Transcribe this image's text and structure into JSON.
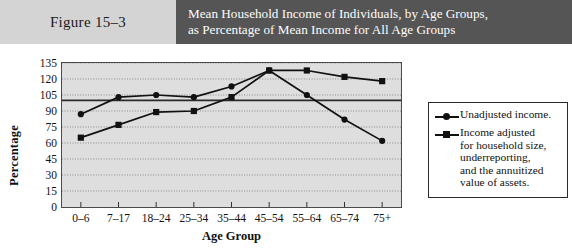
{
  "header": {
    "figure_label": "Figure 15–3",
    "title_lines": [
      "Mean Household Income of Individuals, by Age Groups,",
      "as Percentage of Mean Income for All Age Groups"
    ],
    "figure_band_color": "#d4d4d4",
    "title_band_color": "#555555"
  },
  "legend": {
    "entries": [
      {
        "marker": "circle",
        "lines": [
          "Unadjusted income."
        ]
      },
      {
        "marker": "square",
        "lines": [
          "Income adjusted",
          "for household size,",
          "underreporting,",
          "and the annuitized",
          "value of assets."
        ]
      }
    ]
  },
  "chart_data": {
    "type": "line",
    "title": "Mean Household Income of Individuals, by Age Groups, as Percentage of Mean Income for All Age Groups",
    "xlabel": "Age Group",
    "ylabel": "Percentage",
    "categories": [
      "0–6",
      "7–17",
      "18–24",
      "25–34",
      "35–44",
      "45–54",
      "55–64",
      "65–74",
      "75+"
    ],
    "yticks": [
      0,
      15,
      30,
      45,
      60,
      75,
      90,
      105,
      120,
      135
    ],
    "ylim": [
      0,
      135
    ],
    "grid": true,
    "legend_position": "right",
    "reference_line": {
      "value": 100,
      "label": "100%"
    },
    "series": [
      {
        "name": "Unadjusted income.",
        "marker": "circle",
        "values": [
          87,
          103,
          105,
          103,
          113,
          128,
          105,
          82,
          62
        ]
      },
      {
        "name": "Income adjusted for household size, underreporting, and the annuitized value of assets.",
        "marker": "square",
        "values": [
          65,
          77,
          89,
          90,
          103,
          128,
          128,
          122,
          118
        ]
      }
    ]
  }
}
